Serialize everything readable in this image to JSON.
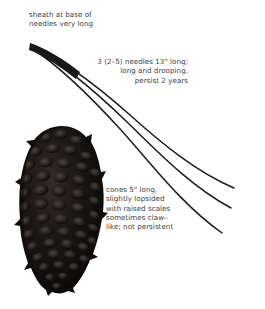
{
  "plate": {
    "title": "pine-identification-plate",
    "background_color": "#ffffff",
    "text_color": "#3b3b3d",
    "ink_color": "#1a1a1a"
  },
  "annotations": [
    {
      "id": "sheath",
      "name": "annotation-sheath",
      "text": "sheath at base of\nneedles very long",
      "align": "left"
    },
    {
      "id": "needles",
      "name": "annotation-needles",
      "text": "3 (2–5) needles 13\" long;\nlong and drooping,\npersist 2 years",
      "align": "right"
    },
    {
      "id": "cones",
      "name": "annotation-cones",
      "text": "cones 5\" long,\nslightly lopsided\nwith raised scales\nsometimes claw–\nlike; not persistent",
      "align": "left"
    }
  ],
  "illustration": {
    "needles": {
      "count": 3,
      "label": "pine-needle-fascicle",
      "sheath_label": "needle-sheath-base",
      "sheath_origin": [
        30,
        44
      ],
      "color": "#161616"
    },
    "cone": {
      "label": "pine-cone",
      "color": "#120f0e",
      "highlight_color": "#3a3330",
      "bbox": [
        18,
        126,
        100,
        293
      ],
      "scale_rows": 15
    }
  }
}
